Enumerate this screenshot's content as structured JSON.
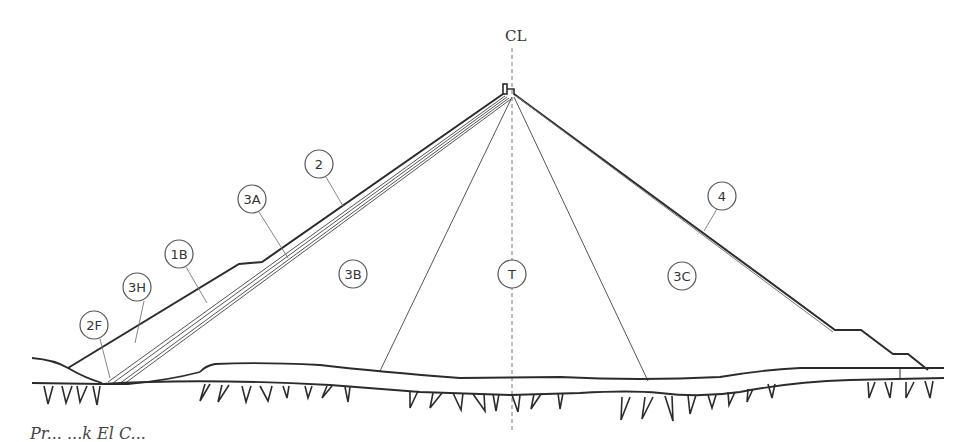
{
  "diagram": {
    "type": "dam-cross-section",
    "centerline_label": "CL",
    "zones": [
      {
        "id": "2F",
        "label": "2F",
        "x": 94,
        "y": 325
      },
      {
        "id": "3H",
        "label": "3H",
        "x": 137,
        "y": 287
      },
      {
        "id": "1B",
        "label": "1B",
        "x": 179,
        "y": 254
      },
      {
        "id": "3A",
        "label": "3A",
        "x": 252,
        "y": 199
      },
      {
        "id": "2",
        "label": "2",
        "x": 319,
        "y": 164
      },
      {
        "id": "3B",
        "label": "3B",
        "x": 353,
        "y": 274
      },
      {
        "id": "T",
        "label": "T",
        "x": 512,
        "y": 274
      },
      {
        "id": "3C",
        "label": "3C",
        "x": 682,
        "y": 276
      },
      {
        "id": "4",
        "label": "4",
        "x": 722,
        "y": 196
      }
    ],
    "colors": {
      "line": "#2b2b2b",
      "thin_line": "#555555",
      "label": "#333333",
      "background": "#ffffff"
    }
  },
  "caption": {
    "text": "Pr... ...k El C..."
  }
}
